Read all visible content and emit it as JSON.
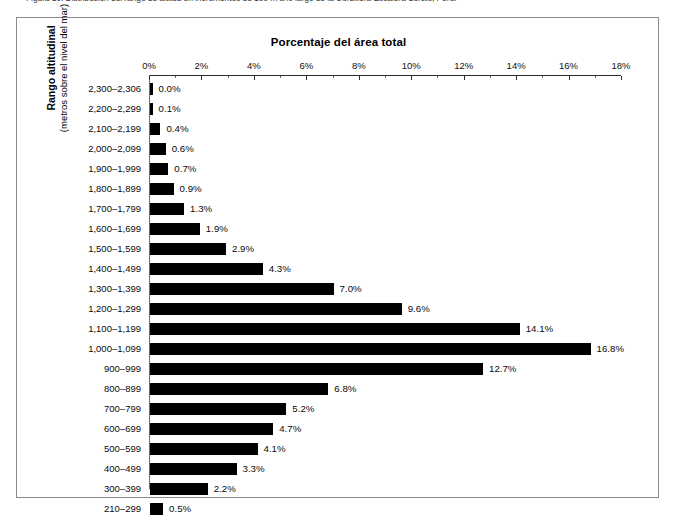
{
  "caption": {
    "clipped_text": "Figura 10. Distribución del rango de altitud en incrementos de 100 m a lo largo de la Cordillera Escalera-Loreto, Perú."
  },
  "figure": {
    "title": "Porcentaje del área total",
    "y_axis_title_line1": "Rango altitudinal",
    "y_axis_title_line2": "(metros sobre el nivel del mar)"
  },
  "chart_data": {
    "type": "bar",
    "orientation": "horizontal",
    "title": "Porcentaje del área total",
    "xlabel": "Porcentaje del área total",
    "ylabel": "Rango altitudinal (metros sobre el nivel del mar)",
    "xlim": [
      0,
      18
    ],
    "xtick_labels": [
      "0%",
      "2%",
      "4%",
      "6%",
      "8%",
      "10%",
      "12%",
      "14%",
      "16%",
      "18%"
    ],
    "xticks": [
      0,
      2,
      4,
      6,
      8,
      10,
      12,
      14,
      16,
      18
    ],
    "minor_tick_interval": 1,
    "grid": false,
    "legend": false,
    "bar_color": "#000000",
    "categories": [
      "2,300–2,306",
      "2,200–2,299",
      "2,100–2,199",
      "2,000–2,099",
      "1,900–1,999",
      "1,800–1,899",
      "1,700–1,799",
      "1,600–1,699",
      "1,500–1,599",
      "1,400–1,499",
      "1,300–1,399",
      "1,200–1,299",
      "1,100–1,199",
      "1,000–1,099",
      "900–999",
      "800–899",
      "700–799",
      "600–699",
      "500–599",
      "400–499",
      "300–399",
      "210–299"
    ],
    "values": [
      0.0,
      0.1,
      0.4,
      0.6,
      0.7,
      0.9,
      1.3,
      1.9,
      2.9,
      4.3,
      7.0,
      9.6,
      14.1,
      16.8,
      12.7,
      6.8,
      5.2,
      4.7,
      4.1,
      3.3,
      2.2,
      0.5
    ],
    "value_labels": [
      "0.0%",
      "0.1%",
      "0.4%",
      "0.6%",
      "0.7%",
      "0.9%",
      "1.3%",
      "1.9%",
      "2.9%",
      "4.3%",
      "7.0%",
      "9.6%",
      "14.1%",
      "16.8%",
      "12.7%",
      "6.8%",
      "5.2%",
      "4.7%",
      "4.1%",
      "3.3%",
      "2.2%",
      "0.5%"
    ]
  }
}
